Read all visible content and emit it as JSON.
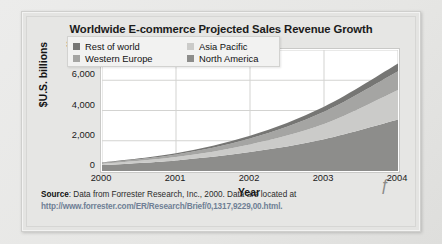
{
  "chart_data": {
    "type": "area",
    "title": "Worldwide E-commerce Projected Sales Revenue Growth",
    "xlabel": "Year",
    "ylabel": "$U.S. billions",
    "stacked": true,
    "grid": true,
    "legend_position": "top-left-inside",
    "x": [
      2000,
      2001,
      2002,
      2003,
      2004
    ],
    "xtick_labels": [
      "2000",
      "2001",
      "2002",
      "2003",
      "2004"
    ],
    "ytick_labels": [
      "$8,000",
      "6,000",
      "4,000",
      "2,000",
      "0"
    ],
    "ylim": [
      0,
      8000
    ],
    "ytick_values": [
      8000,
      6000,
      4000,
      2000,
      0
    ],
    "series": [
      {
        "name": "North America",
        "color": "#8d8d8b",
        "values": [
          390,
          700,
          1250,
          2100,
          3400
        ]
      },
      {
        "name": "Asia Pacific",
        "color": "#cbcbc9",
        "values": [
          80,
          220,
          500,
          1000,
          1950
        ]
      },
      {
        "name": "Western Europe",
        "color": "#a5a5a3",
        "values": [
          60,
          170,
          400,
          820,
          1250
        ]
      },
      {
        "name": "Rest of world",
        "color": "#767674",
        "values": [
          40,
          90,
          180,
          330,
          510
        ]
      }
    ],
    "totals": [
      570,
      1180,
      2330,
      4250,
      7110
    ],
    "legend_entries": [
      {
        "label": "Rest of world",
        "color": "#767674"
      },
      {
        "label": "Asia Pacific",
        "color": "#cbcbc9"
      },
      {
        "label": "Western Europe",
        "color": "#a5a5a3"
      },
      {
        "label": "North America",
        "color": "#8d8d8b"
      }
    ]
  },
  "source": {
    "prefix": "Source",
    "text": ": Data from Forrester Research, Inc., 2000. Data are located at",
    "url": "http://www.forrester.com/ER/Research/Brief/0,1317,9229,00.html."
  }
}
